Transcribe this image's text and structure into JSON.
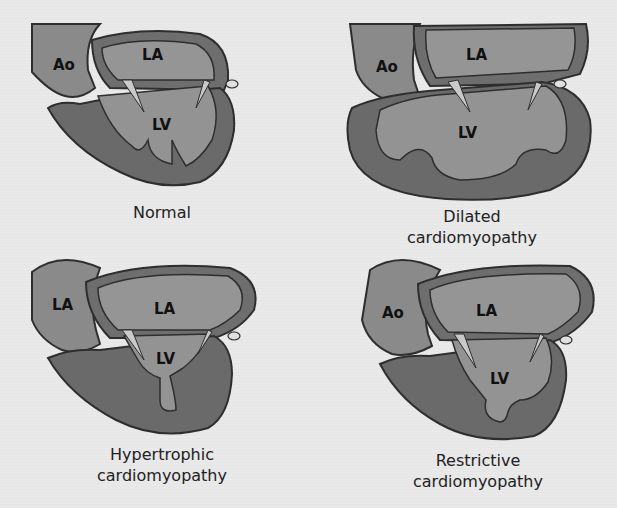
{
  "figure": {
    "panels": [
      {
        "id": "normal",
        "caption_lines": [
          "Normal"
        ],
        "labels": {
          "upper_left": "Ao",
          "upper_right": "LA",
          "lower": "LV"
        }
      },
      {
        "id": "dilated",
        "caption_lines": [
          "Dilated",
          "cardiomyopathy"
        ],
        "labels": {
          "upper_left": "Ao",
          "upper_right": "LA",
          "lower": "LV"
        }
      },
      {
        "id": "hypertrophic",
        "caption_lines": [
          "Hypertrophic",
          "cardiomyopathy"
        ],
        "labels": {
          "upper_left": "LA",
          "upper_right": "LA",
          "lower": "LV"
        }
      },
      {
        "id": "restrictive",
        "caption_lines": [
          "Restrictive",
          "cardiomyopathy"
        ],
        "labels": {
          "upper_left": "Ao",
          "upper_right": "LA",
          "lower": "LV"
        }
      }
    ]
  },
  "colors": {
    "background": "#e9e9e9",
    "wall": "#6e6e6e",
    "chamber": "#8f8f8f",
    "outline": "#2e2e2e",
    "valve": "#c9c9c9"
  }
}
